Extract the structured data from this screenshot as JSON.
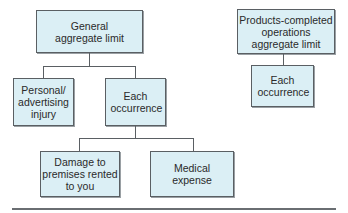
{
  "diagram": {
    "colors": {
      "box_fill": "#dbeff5",
      "box_border": "#5a5f63",
      "connector": "#5a5f63"
    },
    "left_tree": {
      "root": {
        "label": "General aggregate limit"
      },
      "children": [
        {
          "label": "Personal/ advertising injury"
        },
        {
          "label": "Each occurrence"
        }
      ],
      "grandchildren": [
        {
          "label": "Damage to premises rented to you"
        },
        {
          "label": "Medical expense"
        }
      ]
    },
    "right_tree": {
      "root": {
        "label": "Products-completed operations aggregate limit"
      },
      "child": {
        "label": "Each occurrence"
      }
    }
  }
}
